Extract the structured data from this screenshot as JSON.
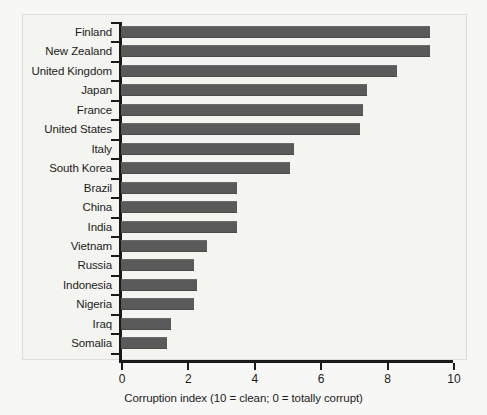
{
  "chart_data": {
    "type": "bar",
    "orientation": "horizontal",
    "title": "",
    "xlabel": "Corruption index (10 = clean; 0 = totally corrupt)",
    "ylabel": "",
    "xlim": [
      0,
      10
    ],
    "xticks": [
      "0",
      "2",
      "4",
      "6",
      "8",
      "10"
    ],
    "grid": false,
    "legend": null,
    "bar_color": "#5a5a5a",
    "axis_color": "#1a1a1a",
    "background_color": "#f4f4f1",
    "categories": [
      "Finland",
      "New Zealand",
      "United Kingdom",
      "Japan",
      "France",
      "United States",
      "Italy",
      "South Korea",
      "Brazil",
      "China",
      "India",
      "Vietnam",
      "Russia",
      "Indonesia",
      "Nigeria",
      "Iraq",
      "Somalia"
    ],
    "values": [
      9.3,
      9.3,
      8.3,
      7.4,
      7.3,
      7.2,
      5.2,
      5.1,
      3.5,
      3.5,
      3.5,
      2.6,
      2.2,
      2.3,
      2.2,
      1.5,
      1.4
    ]
  }
}
